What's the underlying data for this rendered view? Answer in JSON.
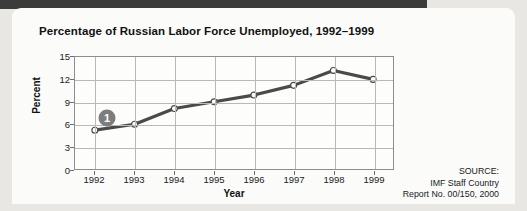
{
  "chart_data": {
    "type": "line",
    "title": "Percentage of Russian Labor Force Unemployed, 1992–1999",
    "xlabel": "Year",
    "ylabel": "Percent",
    "categories": [
      "1992",
      "1993",
      "1994",
      "1995",
      "1996",
      "1997",
      "1998",
      "1999"
    ],
    "values": [
      5.2,
      6.0,
      8.1,
      9.0,
      9.9,
      11.2,
      13.2,
      12.0
    ],
    "ylim": [
      0,
      15
    ],
    "yticks": [
      0,
      3,
      6,
      9,
      12,
      15
    ],
    "grid": true,
    "legend": "none",
    "series": [
      {
        "name": "Percent unemployed",
        "values": [
          5.2,
          6.0,
          8.1,
          9.0,
          9.9,
          11.2,
          13.2,
          12.0
        ]
      }
    ],
    "annotations": [
      {
        "label": "1",
        "x": "1992",
        "y": 7.0,
        "shape": "circle-badge",
        "color": "#7d7d7d"
      }
    ]
  },
  "source": {
    "line1": "SOURCE:",
    "line2": "IMF Staff Country",
    "line3": "Report No. 00/150, 2000"
  },
  "colors": {
    "line": "#4a4a4a",
    "marker_fill": "#ffffff",
    "grid": "#b9b9b9",
    "frame": "#8d8d8d",
    "badge": "#7d7d7d",
    "page_background": "#e9e7e4",
    "card_background": "#fbfbfa"
  }
}
